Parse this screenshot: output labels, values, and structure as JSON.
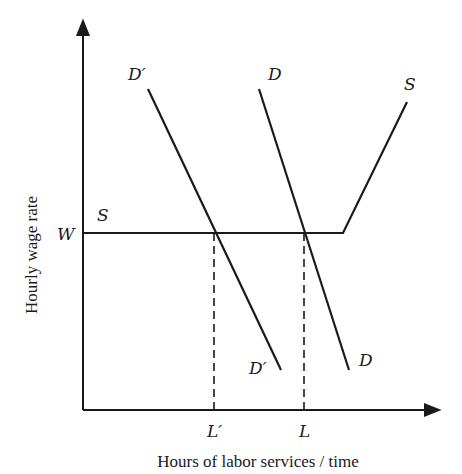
{
  "diagram": {
    "axes": {
      "x_label": "Hours of labor services / time",
      "y_label": "Hourly wage rate",
      "origin": [
        83,
        410
      ],
      "x_end": 440,
      "y_end": 45
    },
    "wage_level": {
      "label": "W",
      "y": 233
    },
    "supply_curve": {
      "label_left": "S",
      "label_right": "S",
      "points": [
        [
          83,
          233
        ],
        [
          343,
          233
        ],
        [
          407,
          102
        ]
      ]
    },
    "demand_curves": [
      {
        "name": "D'",
        "label_top": "D′",
        "label_bottom": "D′",
        "points": [
          [
            148,
            89
          ],
          [
            281,
            370
          ]
        ]
      },
      {
        "name": "D",
        "label_top": "D",
        "label_bottom": "D",
        "points": [
          [
            259,
            89
          ],
          [
            349,
            370
          ]
        ]
      }
    ],
    "quantity_markers": [
      {
        "label": "L′",
        "x": 214
      },
      {
        "label": "L",
        "x": 304
      }
    ],
    "colors": {
      "ink": "#1a1a1a",
      "background": "#ffffff"
    }
  }
}
